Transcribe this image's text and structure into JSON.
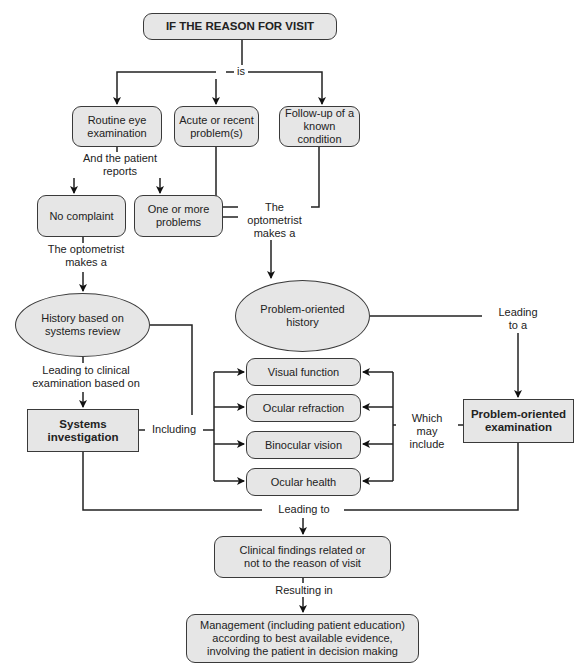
{
  "diagram": {
    "nodes": {
      "start": "IF THE REASON FOR VISIT",
      "routine": "Routine eye\nexamination",
      "acute": "Acute or recent\nproblem(s)",
      "followup": "Follow-up of a\nknown condition",
      "no_complaint": "No complaint",
      "one_or_more": "One or more\nproblems",
      "history_systems": "History based on\nsystems review",
      "problem_history": "Problem-oriented\nhistory",
      "systems_investigation": "Systems\ninvestigation",
      "problem_exam": "Problem-oriented\nexamination",
      "visual_function": "Visual function",
      "ocular_refraction": "Ocular refraction",
      "binocular_vision": "Binocular vision",
      "ocular_health": "Ocular health",
      "clinical_findings": "Clinical findings related or\nnot to the reason of visit",
      "management": "Management (including patient education)\naccording to best available evidence,\ninvolving the patient in decision making"
    },
    "edge_labels": {
      "is": "is",
      "patient_reports": "And the patient reports",
      "optometrist_left": "The optometrist\nmakes a",
      "optometrist_center": "The optometrist\nmakes a",
      "leading_clinical": "Leading to clinical\nexamination based on",
      "leading_to_a": "Leading\nto a",
      "including": "Including",
      "which_may_include": "Which\nmay include",
      "leading_to": "Leading to",
      "resulting_in": "Resulting in"
    }
  }
}
